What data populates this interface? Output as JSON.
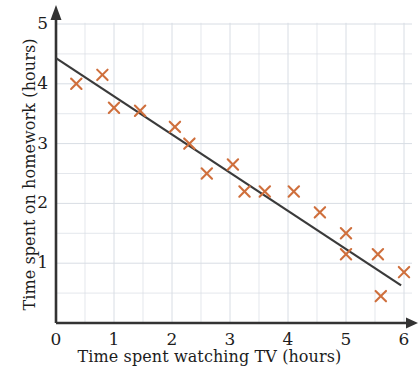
{
  "chart_data": {
    "type": "scatter",
    "title": "",
    "xlabel": "Time spent watching TV (hours)",
    "ylabel": "Time spent on homework (hours)",
    "xlim": [
      0,
      6
    ],
    "ylim": [
      0,
      5
    ],
    "xticks": [
      0,
      1,
      2,
      3,
      4,
      5,
      6
    ],
    "yticks": [
      1,
      2,
      3,
      4,
      5
    ],
    "xtick_labels": [
      "0",
      "1",
      "2",
      "3",
      "4",
      "5",
      "6"
    ],
    "ytick_labels": [
      "1",
      "2",
      "3",
      "4",
      "5"
    ],
    "grid": true,
    "grid_minor_step": 0.5,
    "legend": null,
    "marker": "x",
    "marker_color": "#cf6f3c",
    "axis_color": "#333333",
    "grid_color": "#d8dde4",
    "trendline_color": "#3a3a3a",
    "points": [
      {
        "x": 0.35,
        "y": 4.0
      },
      {
        "x": 0.8,
        "y": 4.15
      },
      {
        "x": 1.0,
        "y": 3.6
      },
      {
        "x": 1.45,
        "y": 3.55
      },
      {
        "x": 2.05,
        "y": 3.28
      },
      {
        "x": 2.3,
        "y": 3.0
      },
      {
        "x": 2.6,
        "y": 2.5
      },
      {
        "x": 3.05,
        "y": 2.65
      },
      {
        "x": 3.25,
        "y": 2.2
      },
      {
        "x": 3.6,
        "y": 2.2
      },
      {
        "x": 4.1,
        "y": 2.2
      },
      {
        "x": 4.55,
        "y": 1.85
      },
      {
        "x": 5.0,
        "y": 1.5
      },
      {
        "x": 5.0,
        "y": 1.15
      },
      {
        "x": 5.55,
        "y": 1.15
      },
      {
        "x": 5.6,
        "y": 0.45
      },
      {
        "x": 6.0,
        "y": 0.85
      }
    ],
    "trendline": {
      "x0": 0.0,
      "y0": 4.43,
      "x1": 5.95,
      "y1": 0.63
    }
  }
}
